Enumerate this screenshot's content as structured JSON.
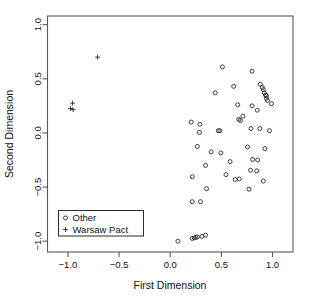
{
  "chart_data": {
    "type": "scatter",
    "title": "",
    "xlabel": "First Dimension",
    "ylabel": "Second Dimension",
    "xlim": [
      -1.2,
      1.2
    ],
    "ylim": [
      -1.1,
      1.08
    ],
    "xticks": [
      -1.0,
      -0.5,
      0.0,
      0.5,
      1.0
    ],
    "yticks": [
      -1.0,
      -0.5,
      0.0,
      0.5,
      1.0
    ],
    "xticklabels": [
      "-1.0",
      "-0.5",
      "0.0",
      "0.5",
      "1.0"
    ],
    "yticklabels": [
      "-1.0",
      "-0.5",
      "0.0",
      "0.5",
      "1.0"
    ],
    "grid": false,
    "legend_position": "bottom-left",
    "series": [
      {
        "name": "Other",
        "marker": "circle",
        "color": "#2a2a2a",
        "points": [
          [
            0.51,
            0.61
          ],
          [
            0.8,
            0.57
          ],
          [
            0.62,
            0.43
          ],
          [
            0.88,
            0.45
          ],
          [
            0.9,
            0.42
          ],
          [
            0.91,
            0.4
          ],
          [
            0.92,
            0.37
          ],
          [
            0.93,
            0.35
          ],
          [
            0.94,
            0.345
          ],
          [
            0.44,
            0.37
          ],
          [
            0.94,
            0.32
          ],
          [
            0.95,
            0.3
          ],
          [
            0.99,
            0.27
          ],
          [
            0.66,
            0.26
          ],
          [
            0.8,
            0.25
          ],
          [
            0.85,
            0.21
          ],
          [
            0.71,
            0.155
          ],
          [
            0.67,
            0.125
          ],
          [
            0.685,
            0.115
          ],
          [
            0.205,
            0.1
          ],
          [
            0.29,
            0.08
          ],
          [
            0.285,
            0.005
          ],
          [
            0.47,
            0.02
          ],
          [
            0.485,
            0.02
          ],
          [
            0.79,
            0.04
          ],
          [
            0.875,
            0.04
          ],
          [
            0.97,
            0.02
          ],
          [
            0.265,
            -0.125
          ],
          [
            0.4,
            -0.175
          ],
          [
            0.495,
            -0.185
          ],
          [
            0.755,
            -0.13
          ],
          [
            0.925,
            -0.145
          ],
          [
            0.345,
            -0.3
          ],
          [
            0.585,
            -0.265
          ],
          [
            0.805,
            -0.245
          ],
          [
            0.855,
            -0.25
          ],
          [
            0.215,
            -0.405
          ],
          [
            0.545,
            -0.385
          ],
          [
            0.635,
            -0.43
          ],
          [
            0.675,
            -0.425
          ],
          [
            0.785,
            -0.345
          ],
          [
            0.845,
            -0.35
          ],
          [
            0.91,
            -0.445
          ],
          [
            0.355,
            -0.515
          ],
          [
            0.77,
            -0.52
          ],
          [
            0.215,
            -0.635
          ],
          [
            0.295,
            -0.635
          ],
          [
            0.075,
            -1.0
          ],
          [
            0.215,
            -0.975
          ],
          [
            0.235,
            -0.97
          ],
          [
            0.25,
            -0.965
          ],
          [
            0.265,
            -0.96
          ],
          [
            0.31,
            -0.955
          ],
          [
            0.345,
            -0.945
          ]
        ]
      },
      {
        "name": "Warsaw Pact",
        "marker": "plus",
        "color": "#2a2a2a",
        "points": [
          [
            -0.71,
            0.7
          ],
          [
            -0.955,
            0.275
          ],
          [
            -0.975,
            0.225
          ],
          [
            -0.95,
            0.215
          ]
        ]
      }
    ]
  },
  "legend": {
    "items": [
      {
        "label": "Other",
        "marker": "circle"
      },
      {
        "label": "Warsaw Pact",
        "marker": "plus"
      }
    ]
  }
}
